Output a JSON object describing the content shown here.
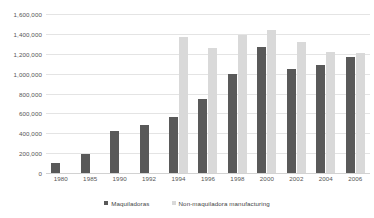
{
  "chart_data": {
    "type": "bar",
    "title": "",
    "subtitle": "",
    "xlabel": "",
    "ylabel": "",
    "categories": [
      "1980",
      "1985",
      "1990",
      "1992",
      "1994",
      "1996",
      "1998",
      "2000",
      "2002",
      "2004",
      "2006"
    ],
    "series": [
      {
        "name": "Maquiladoras",
        "color": "#595959",
        "values": [
          100000,
          190000,
          425000,
          480000,
          560000,
          740000,
          995000,
          1265000,
          1050000,
          1090000,
          1170000
        ]
      },
      {
        "name": "Non-maquiladora manufacturing",
        "color": "#d9d9d9",
        "values": [
          null,
          null,
          null,
          null,
          1370000,
          1255000,
          1390000,
          1440000,
          1320000,
          1220000,
          1210000
        ]
      }
    ],
    "ylim": [
      0,
      1600000
    ],
    "ytick_values": [
      0,
      200000,
      400000,
      600000,
      800000,
      1000000,
      1200000,
      1400000,
      1600000
    ],
    "ytick_labels": [
      "0",
      "200,000",
      "400,000",
      "600,000",
      "800,000",
      "1,000,000",
      "1,200,000",
      "1,400,000",
      "1,600,000"
    ],
    "grid": true,
    "legend_position": "bottom",
    "legend_entries": [
      "Maquiladoras",
      "Non-maquiladora manufacturing"
    ],
    "annotations": []
  },
  "colors": {
    "series_dark": "#595959",
    "series_light": "#d9d9d9",
    "gridline": "#e4e4e4",
    "axis_text": "#555555",
    "background": "#ffffff"
  }
}
